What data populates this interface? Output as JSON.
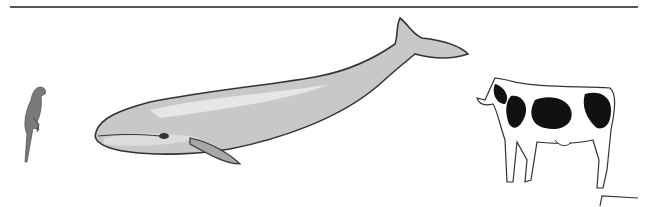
{
  "page": {
    "background": "#ffffff",
    "rule_color": "#555555"
  },
  "figures": [
    {
      "name": "parrot",
      "label": ""
    },
    {
      "name": "whale",
      "label": ""
    },
    {
      "name": "cow",
      "label": ""
    }
  ],
  "colors": {
    "whale_body": "#c8c8c8",
    "whale_highlight": "#e6e6e6",
    "whale_shade": "#a8a8a8",
    "outline": "#333333",
    "cow_spots": "#111111",
    "parrot": "#777777"
  }
}
